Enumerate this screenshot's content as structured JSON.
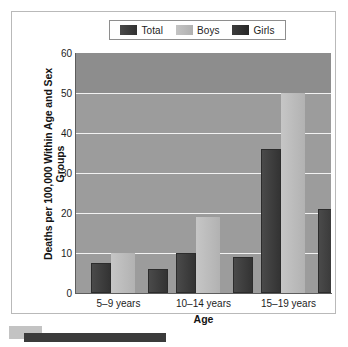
{
  "chart_data": {
    "type": "bar",
    "title": "",
    "categories": [
      "5–9 years",
      "10–14 years",
      "15–19 years"
    ],
    "series": [
      {
        "name": "Total",
        "values": [
          7.5,
          10,
          36
        ],
        "color": "#3a3a3a"
      },
      {
        "name": "Boys",
        "values": [
          10,
          19,
          50
        ],
        "color": "#b8b8b8"
      },
      {
        "name": "Girls",
        "values": [
          6,
          9,
          21
        ],
        "color": "#2f2f2f"
      }
    ],
    "xlabel": "Age",
    "ylabel": "Deaths per 100,000 Within Age and Sex Groups",
    "ylim": [
      0,
      60
    ],
    "yticks": [
      0,
      10,
      20,
      30,
      40,
      50,
      60
    ],
    "grid": true,
    "legend_position": "top",
    "plot_background": "#9c9c9c",
    "gridline_color": "#f2f2f2"
  },
  "legend": {
    "items": [
      {
        "label": "Total",
        "color": "#3a3a3a"
      },
      {
        "label": "Boys",
        "color": "#b8b8b8"
      },
      {
        "label": "Girls",
        "color": "#2f2f2f"
      }
    ]
  },
  "axes": {
    "y_title": "Deaths per 100,000 Within Age and Sex Groups",
    "x_title": "Age",
    "y_ticks": [
      "60",
      "50",
      "40",
      "30",
      "20",
      "10",
      "0"
    ],
    "x_ticks": [
      "5–9 years",
      "10–14 years",
      "15–19 years"
    ]
  }
}
